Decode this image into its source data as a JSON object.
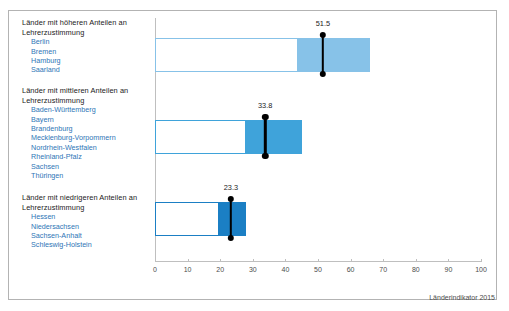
{
  "chart_data": {
    "type": "bar",
    "title": "",
    "subtitle": "",
    "xlabel": "",
    "ylabel": "",
    "xlim": [
      0,
      100
    ],
    "xticks": [
      0,
      10,
      20,
      30,
      40,
      50,
      60,
      70,
      80,
      90,
      100
    ],
    "xtick_labels": [
      "0",
      "10",
      "20",
      "30",
      "40",
      "50",
      "60",
      "70",
      "80",
      "90",
      "100"
    ],
    "grid": false,
    "legend": "none",
    "orientation": "horizontal",
    "source_note": "Länderindikator 2015",
    "categories": [
      "Länder mit höheren Anteilen an Lehrerzustimmung",
      "Länder mit mittleren Anteilen an Lehrerzustimmung",
      "Länder mit niedrigeren Anteilen an Lehrerzustimmung"
    ],
    "series": [
      {
        "name": "Bereich (Box) Start",
        "values": [
          44.0,
          28.0,
          19.5
        ]
      },
      {
        "name": "Bereich (Box) Ende",
        "values": [
          66.0,
          45.0,
          28.0
        ]
      },
      {
        "name": "Mittelwert (Marker)",
        "values": [
          51.5,
          33.8,
          23.3
        ]
      }
    ],
    "marker_labels": [
      "51.5",
      "33.8",
      "23.3"
    ]
  },
  "groups": [
    {
      "heading": "Länder mit höheren Anteilen an Lehrerzustimmung",
      "members": [
        "Berlin",
        "Bremen",
        "Hamburg",
        "Saarland"
      ],
      "bar": {
        "box_start": 44.0,
        "box_end": 66.0,
        "marker": 51.5,
        "marker_label": "51.5",
        "fill_color": "#87c2e8",
        "outline_color": "#87c2e8"
      }
    },
    {
      "heading": "Länder mit mittleren Anteilen an Lehrerzustimmung",
      "members": [
        "Baden-Württemberg",
        "Bayern",
        "Brandenburg",
        "Mecklenburg-Vorpommern",
        "Nordrhein-Westfalen",
        "Rheinland-Pfalz",
        "Sachsen",
        "Thüringen"
      ],
      "bar": {
        "box_start": 28.0,
        "box_end": 45.0,
        "marker": 33.8,
        "marker_label": "33.8",
        "fill_color": "#3fa3da",
        "outline_color": "#3fa3da"
      }
    },
    {
      "heading": "Länder mit niedrigeren Anteilen an Lehrerzustimmung",
      "members": [
        "Hessen",
        "Niedersachsen",
        "Sachsen-Anhalt",
        "Schleswig-Holstein"
      ],
      "bar": {
        "box_start": 19.5,
        "box_end": 28.0,
        "marker": 23.3,
        "marker_label": "23.3",
        "fill_color": "#1b7fc4",
        "outline_color": "#1b7fc4"
      }
    }
  ],
  "axis": {
    "ticks": [
      "0",
      "10",
      "20",
      "30",
      "40",
      "50",
      "60",
      "70",
      "80",
      "90",
      "100"
    ]
  },
  "footer": {
    "source": "Länderindikator 2015"
  }
}
